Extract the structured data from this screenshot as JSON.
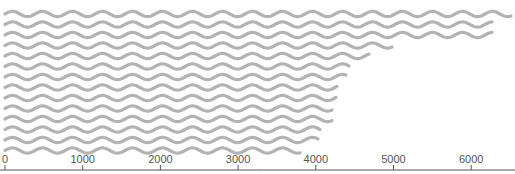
{
  "chart_data": {
    "type": "bar",
    "style": "wavy-horizontal-lines",
    "title": "",
    "xlabel": "",
    "ylabel": "",
    "orientation": "horizontal",
    "xlim": [
      0,
      6600
    ],
    "grid": false,
    "legend": null,
    "x_ticks": [
      0,
      1000,
      2000,
      3000,
      4000,
      5000,
      6000
    ],
    "x_tick_labels": [
      "0",
      "1000",
      "2000",
      "3000",
      "4000",
      "5000",
      "6000"
    ],
    "categories": [
      "1",
      "2",
      "3",
      "4",
      "5",
      "6",
      "7",
      "8",
      "9",
      "10",
      "11",
      "12",
      "13",
      "14"
    ],
    "values": [
      6525,
      6280,
      6270,
      4990,
      4685,
      4440,
      4400,
      4285,
      4270,
      4220,
      4210,
      4065,
      4030,
      3800
    ],
    "color": "#b3b3b3"
  },
  "axis": {
    "color": "#555555",
    "origin_px": 5,
    "px_per_1000": 77.7,
    "baseline_y": 170
  },
  "layout": {
    "first_row_y": 14,
    "row_spacing": 10.5,
    "wave_period": 30,
    "wave_amplitude": 2.6
  }
}
